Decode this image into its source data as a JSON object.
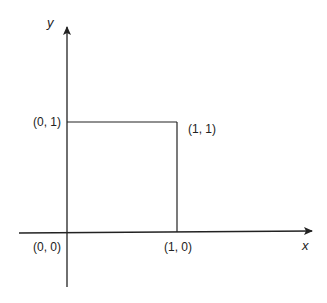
{
  "diagram": {
    "axes": {
      "x_label": "x",
      "y_label": "y"
    },
    "points": [
      {
        "id": "origin",
        "label": "(0, 0)"
      },
      {
        "id": "p10",
        "label": "(1, 0)"
      },
      {
        "id": "p01",
        "label": "(0, 1)"
      },
      {
        "id": "p11",
        "label": "(1, 1)"
      }
    ],
    "shape": "unit square",
    "colors": {
      "line": "#222222",
      "background": "#ffffff"
    }
  }
}
